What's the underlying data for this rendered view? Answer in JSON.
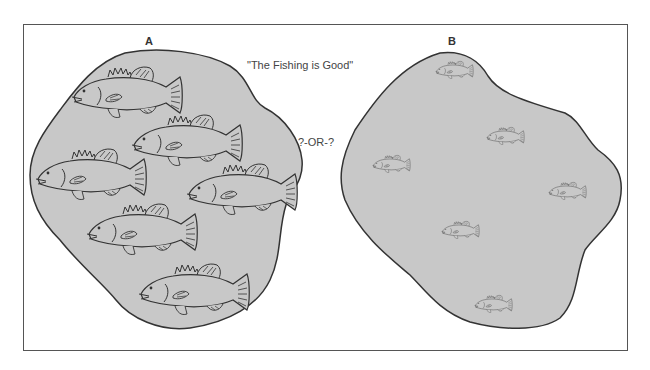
{
  "figure": {
    "panel_a_label": "A",
    "panel_b_label": "B",
    "title_quote": "\"The Fishing is Good\"",
    "separator": "?-OR-?",
    "colors": {
      "pond_fill": "#c8c8c8",
      "outline": "#333333",
      "frame": "#555555",
      "background": "#ffffff"
    },
    "panel_a": {
      "fish_count": 6,
      "fish_size": "large"
    },
    "panel_b": {
      "fish_count": 6,
      "fish_size": "small"
    }
  }
}
